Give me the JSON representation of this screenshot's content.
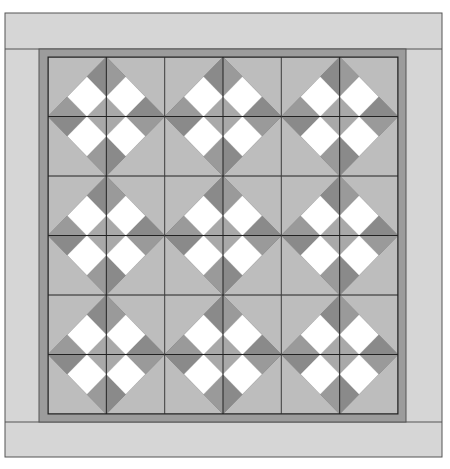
{
  "diagram": {
    "type": "quilt-layout",
    "blocks_across": 3,
    "blocks_down": 3,
    "cells_per_block": 2,
    "block_pattern": "diamond-in-square with four white squares (rotated 3x3 grid)",
    "geometry": {
      "outer_border": {
        "x": 5,
        "y": 13,
        "right": 442,
        "bottom": 457
      },
      "top_band_bottom": 49,
      "bottom_band_top": 422,
      "left_band_right": 39,
      "right_band_left": 406,
      "inner_area": {
        "x": 48,
        "y": 57,
        "right": 398,
        "bottom": 414
      }
    },
    "colors": {
      "page_background": "#ffffff",
      "outer_border_fabric": "#d6d6d6",
      "inner_border_strip": "#9c9c9c",
      "block_background": "#bdbdbd",
      "diamond_center": "#a9a9a9",
      "corner_dark": "#8a8a8a",
      "corner_dark_alt": "#9a9a9a",
      "white_square": "#ffffff",
      "seam_line": "#222222",
      "outline": "#555555"
    }
  }
}
